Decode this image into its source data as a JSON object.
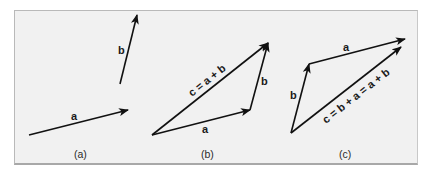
{
  "diagram": {
    "panels": [
      {
        "id": "a",
        "caption": "(a)",
        "vectors": [
          {
            "name": "a",
            "label": "a",
            "from": [
              29,
              135
            ],
            "to": [
              128,
              110
            ]
          },
          {
            "name": "b",
            "label": "b",
            "from": [
              120,
              84
            ],
            "to": [
              137,
              15
            ]
          }
        ]
      },
      {
        "id": "b",
        "caption": "(b)",
        "vectors": [
          {
            "name": "a",
            "label": "a",
            "from": [
              152,
              135
            ],
            "to": [
              250,
              110
            ]
          },
          {
            "name": "b",
            "label": "b",
            "from": [
              250,
              110
            ],
            "to": [
              268,
              43
            ]
          },
          {
            "name": "c",
            "label": "c = a + b",
            "from": [
              152,
              135
            ],
            "to": [
              268,
              43
            ]
          }
        ]
      },
      {
        "id": "c",
        "caption": "(c)",
        "vectors": [
          {
            "name": "b",
            "label": "b",
            "from": [
              291,
              133
            ],
            "to": [
              309,
              64
            ]
          },
          {
            "name": "a",
            "label": "a",
            "from": [
              309,
              64
            ],
            "to": [
              405,
              39
            ]
          },
          {
            "name": "c",
            "label": "c = b + a = a + b",
            "from": [
              291,
              133
            ],
            "to": [
              401,
              47
            ]
          }
        ]
      }
    ],
    "colors": {
      "background": "#f1f1f1",
      "arrow": "#111111",
      "border": "#b0b0b0"
    }
  }
}
